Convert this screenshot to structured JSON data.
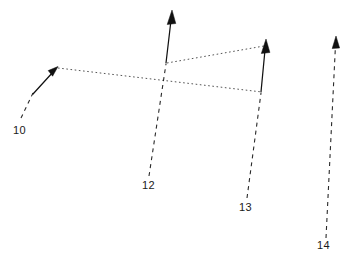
{
  "figure": {
    "kind": "patent-line-drawing",
    "background_color": "#ffffff",
    "ink_color": "#111111",
    "width": 350,
    "height": 274,
    "reference_labels": [
      {
        "id": "label-10",
        "text": "10",
        "x": 13,
        "y": 124
      },
      {
        "id": "label-12",
        "text": "12",
        "x": 142,
        "y": 179
      },
      {
        "id": "label-13",
        "text": "13",
        "x": 239,
        "y": 201
      },
      {
        "id": "label-14",
        "text": "14",
        "x": 317,
        "y": 239
      }
    ],
    "arrows": [
      {
        "id": "arrow-10",
        "label": "10",
        "style": "solid",
        "from_x": 31,
        "from_y": 95,
        "to_x": 57,
        "to_y": 67
      },
      {
        "id": "arrow-12",
        "label": "12",
        "style": "solid",
        "from_x": 166,
        "from_y": 63,
        "to_x": 172,
        "to_y": 11
      },
      {
        "id": "arrow-13",
        "label": "13",
        "style": "solid",
        "from_x": 261,
        "from_y": 92,
        "to_x": 266,
        "to_y": 40
      },
      {
        "id": "arrow-14",
        "label": "14",
        "style": "dashed",
        "from_x": 326,
        "from_y": 238,
        "to_x": 336,
        "to_y": 37
      }
    ],
    "leader_lines": [
      {
        "id": "leader-10",
        "from_x": 21,
        "from_y": 118,
        "to_x": 33,
        "to_y": 93
      },
      {
        "id": "leader-12",
        "from_x": 149,
        "from_y": 176,
        "to_x": 166,
        "to_y": 64
      },
      {
        "id": "leader-13",
        "from_x": 247,
        "from_y": 198,
        "to_x": 261,
        "to_y": 93
      }
    ],
    "dotted_rays": [
      {
        "id": "ray-lower",
        "note": "long dotted ray from arrow-10 tip across to arrow-13 base",
        "from_x": 58,
        "from_y": 68,
        "to_x": 262,
        "to_y": 92
      },
      {
        "id": "ray-upper",
        "note": "dotted ray from arrow-12 base up to arrow-13 tip region",
        "from_x": 167,
        "from_y": 63,
        "to_x": 264,
        "to_y": 46
      }
    ]
  }
}
